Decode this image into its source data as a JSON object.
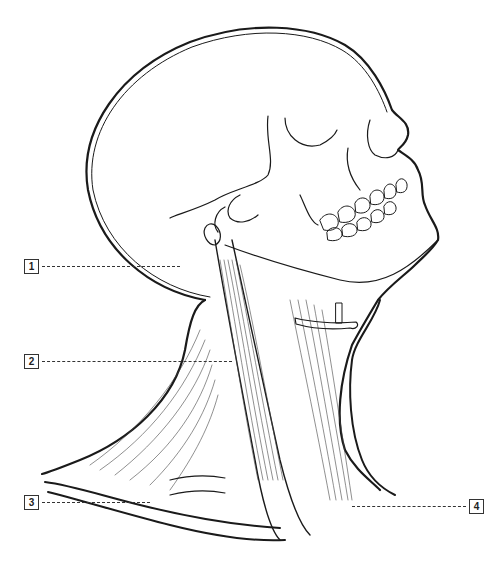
{
  "diagram": {
    "labels": [
      {
        "id": "1",
        "text": "1"
      },
      {
        "id": "2",
        "text": "2"
      },
      {
        "id": "3",
        "text": "3"
      },
      {
        "id": "4",
        "text": "4"
      }
    ],
    "colors": {
      "line": "#1a1a1a",
      "background": "#ffffff"
    }
  }
}
